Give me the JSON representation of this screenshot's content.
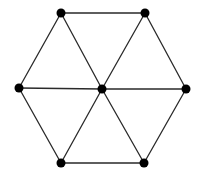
{
  "diagram": {
    "type": "graph",
    "colors": {
      "background": "#ffffff",
      "edge": "#2a2a2a",
      "vertex": "#000000"
    },
    "vertex_radius": 4.5,
    "vertices": [
      {
        "id": "top-left",
        "x": 61,
        "y": 13
      },
      {
        "id": "top-right",
        "x": 145,
        "y": 13
      },
      {
        "id": "left",
        "x": 19,
        "y": 88
      },
      {
        "id": "center",
        "x": 102,
        "y": 89
      },
      {
        "id": "right",
        "x": 186,
        "y": 89
      },
      {
        "id": "bottom-left",
        "x": 61,
        "y": 163
      },
      {
        "id": "bottom-right",
        "x": 144,
        "y": 163
      }
    ],
    "edges": [
      [
        "top-left",
        "top-right"
      ],
      [
        "top-right",
        "right"
      ],
      [
        "right",
        "bottom-right"
      ],
      [
        "bottom-right",
        "bottom-left"
      ],
      [
        "bottom-left",
        "left"
      ],
      [
        "left",
        "top-left"
      ],
      [
        "center",
        "top-left"
      ],
      [
        "center",
        "top-right"
      ],
      [
        "center",
        "right"
      ],
      [
        "center",
        "bottom-right"
      ],
      [
        "center",
        "bottom-left"
      ],
      [
        "center",
        "left"
      ]
    ]
  }
}
